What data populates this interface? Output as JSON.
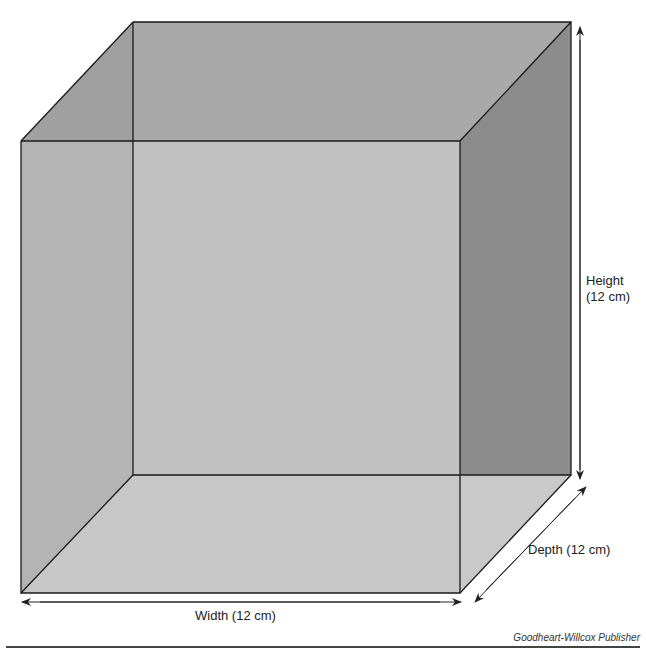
{
  "figure": {
    "type": "cube-diagram",
    "labels": {
      "height_line1": "Height",
      "height_line2": "(12 cm)",
      "depth": "Depth (12 cm)",
      "width": "Width (12 cm)"
    },
    "credit": "Goodheart-Willcox Publisher",
    "colors": {
      "front_face": "#c4c4c4",
      "top_face": "#a9a9a9",
      "left_face": "#a0a0a0",
      "right_face": "#8c8c8c",
      "bottom_face": "#c9c9c9",
      "back_face": "#bcbcbc",
      "edge": "#1a1a1a"
    }
  }
}
